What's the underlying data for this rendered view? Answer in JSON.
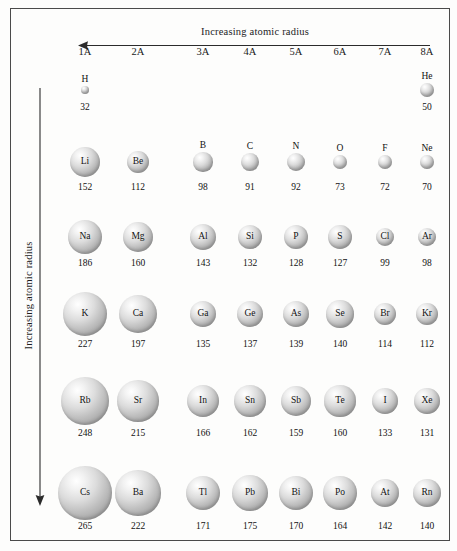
{
  "figure": {
    "title_top": "Increasing atomic radius",
    "title_left": "Increasing atomic radius",
    "top_arrow_direction": "left",
    "left_arrow_direction": "down",
    "units_note": "picometers",
    "border_color": "#4a4a4a",
    "sphere_color": "#c0c0c0"
  },
  "group_headers": [
    "1A",
    "2A",
    "3A",
    "4A",
    "5A",
    "6A",
    "7A",
    "8A"
  ],
  "chart_data": {
    "type": "scatter",
    "xlabel": "Group",
    "ylabel": "Period",
    "categories": [
      "1A",
      "2A",
      "3A",
      "4A",
      "5A",
      "6A",
      "7A",
      "8A"
    ],
    "annotations": [
      "Increasing atomic radius (right to left)",
      "Increasing atomic radius (top to bottom)"
    ],
    "legend": [],
    "grid": false,
    "value_units": "pm",
    "rows": [
      {
        "period": 1,
        "elements": [
          {
            "symbol": "H",
            "group": "1A",
            "radius": 32,
            "label_position": "above"
          },
          {
            "symbol": "He",
            "group": "8A",
            "radius": 50,
            "label_position": "above"
          }
        ]
      },
      {
        "period": 2,
        "elements": [
          {
            "symbol": "Li",
            "group": "1A",
            "radius": 152,
            "label_position": "inside"
          },
          {
            "symbol": "Be",
            "group": "2A",
            "radius": 112,
            "label_position": "inside"
          },
          {
            "symbol": "B",
            "group": "3A",
            "radius": 98,
            "label_position": "above"
          },
          {
            "symbol": "C",
            "group": "4A",
            "radius": 91,
            "label_position": "above"
          },
          {
            "symbol": "N",
            "group": "5A",
            "radius": 92,
            "label_position": "above"
          },
          {
            "symbol": "O",
            "group": "6A",
            "radius": 73,
            "label_position": "above"
          },
          {
            "symbol": "F",
            "group": "7A",
            "radius": 72,
            "label_position": "above"
          },
          {
            "symbol": "Ne",
            "group": "8A",
            "radius": 70,
            "label_position": "above"
          }
        ]
      },
      {
        "period": 3,
        "elements": [
          {
            "symbol": "Na",
            "group": "1A",
            "radius": 186,
            "label_position": "inside"
          },
          {
            "symbol": "Mg",
            "group": "2A",
            "radius": 160,
            "label_position": "inside"
          },
          {
            "symbol": "Al",
            "group": "3A",
            "radius": 143,
            "label_position": "inside"
          },
          {
            "symbol": "Si",
            "group": "4A",
            "radius": 132,
            "label_position": "inside"
          },
          {
            "symbol": "P",
            "group": "5A",
            "radius": 128,
            "label_position": "inside"
          },
          {
            "symbol": "S",
            "group": "6A",
            "radius": 127,
            "label_position": "inside"
          },
          {
            "symbol": "Cl",
            "group": "7A",
            "radius": 99,
            "label_position": "inside"
          },
          {
            "symbol": "Ar",
            "group": "8A",
            "radius": 98,
            "label_position": "inside"
          }
        ]
      },
      {
        "period": 4,
        "elements": [
          {
            "symbol": "K",
            "group": "1A",
            "radius": 227,
            "label_position": "inside"
          },
          {
            "symbol": "Ca",
            "group": "2A",
            "radius": 197,
            "label_position": "inside"
          },
          {
            "symbol": "Ga",
            "group": "3A",
            "radius": 135,
            "label_position": "inside"
          },
          {
            "symbol": "Ge",
            "group": "4A",
            "radius": 137,
            "label_position": "inside"
          },
          {
            "symbol": "As",
            "group": "5A",
            "radius": 139,
            "label_position": "inside"
          },
          {
            "symbol": "Se",
            "group": "6A",
            "radius": 140,
            "label_position": "inside"
          },
          {
            "symbol": "Br",
            "group": "7A",
            "radius": 114,
            "label_position": "inside"
          },
          {
            "symbol": "Kr",
            "group": "8A",
            "radius": 112,
            "label_position": "inside"
          }
        ]
      },
      {
        "period": 5,
        "elements": [
          {
            "symbol": "Rb",
            "group": "1A",
            "radius": 248,
            "label_position": "inside"
          },
          {
            "symbol": "Sr",
            "group": "2A",
            "radius": 215,
            "label_position": "inside"
          },
          {
            "symbol": "In",
            "group": "3A",
            "radius": 166,
            "label_position": "inside"
          },
          {
            "symbol": "Sn",
            "group": "4A",
            "radius": 162,
            "label_position": "inside"
          },
          {
            "symbol": "Sb",
            "group": "5A",
            "radius": 159,
            "label_position": "inside"
          },
          {
            "symbol": "Te",
            "group": "6A",
            "radius": 160,
            "label_position": "inside"
          },
          {
            "symbol": "I",
            "group": "7A",
            "radius": 133,
            "label_position": "inside"
          },
          {
            "symbol": "Xe",
            "group": "8A",
            "radius": 131,
            "label_position": "inside"
          }
        ]
      },
      {
        "period": 6,
        "elements": [
          {
            "symbol": "Cs",
            "group": "1A",
            "radius": 265,
            "label_position": "inside"
          },
          {
            "symbol": "Ba",
            "group": "2A",
            "radius": 222,
            "label_position": "inside"
          },
          {
            "symbol": "Tl",
            "group": "3A",
            "radius": 171,
            "label_position": "inside"
          },
          {
            "symbol": "Pb",
            "group": "4A",
            "radius": 175,
            "label_position": "inside"
          },
          {
            "symbol": "Bi",
            "group": "5A",
            "radius": 170,
            "label_position": "inside"
          },
          {
            "symbol": "Po",
            "group": "6A",
            "radius": 164,
            "label_position": "inside"
          },
          {
            "symbol": "At",
            "group": "7A",
            "radius": 142,
            "label_position": "inside"
          },
          {
            "symbol": "Rn",
            "group": "8A",
            "radius": 140,
            "label_position": "inside"
          }
        ]
      }
    ]
  },
  "layout": {
    "group_x": {
      "1A": 85,
      "2A": 138,
      "3A": 203,
      "4A": 250,
      "5A": 296,
      "6A": 340,
      "7A": 385,
      "8A": 427
    },
    "row_geometry": [
      {
        "period": 1,
        "center_y": 90,
        "value_y": 102,
        "scale": 0.28
      },
      {
        "period": 2,
        "center_y": 162,
        "value_y": 182,
        "scale": 0.197
      },
      {
        "period": 3,
        "center_y": 237,
        "value_y": 258,
        "scale": 0.188
      },
      {
        "period": 4,
        "center_y": 314,
        "value_y": 339,
        "scale": 0.194
      },
      {
        "period": 5,
        "center_y": 401,
        "value_y": 428,
        "scale": 0.194
      },
      {
        "period": 6,
        "center_y": 493,
        "value_y": 521,
        "scale": 0.203
      }
    ]
  }
}
